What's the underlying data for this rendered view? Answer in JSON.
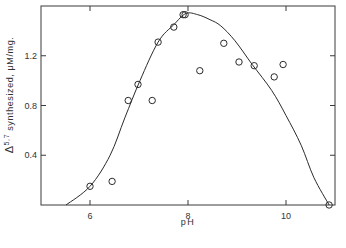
{
  "chart_data": {
    "type": "scatter",
    "title": "",
    "xlabel": "pH",
    "ylabel": "Δ5,7 synthesized, μM/mg.",
    "ylabel_parts": {
      "delta": "Δ",
      "superscript": "5,7",
      "rest": " synthesized, μM/mg."
    },
    "xlim": [
      5.0,
      11.0
    ],
    "ylim": [
      0.0,
      1.6
    ],
    "xticks": [
      6,
      8,
      10
    ],
    "xtick_labels": [
      "6",
      "8",
      "10"
    ],
    "yticks": [
      0.4,
      0.8,
      1.2
    ],
    "ytick_labels": [
      "0.4",
      "0.8",
      "1.2"
    ],
    "grid": false,
    "legend": null,
    "series": [
      {
        "name": "observed",
        "marker": "open-circle",
        "x": [
          6.0,
          6.45,
          6.78,
          6.98,
          7.27,
          7.39,
          7.71,
          7.9,
          7.94,
          8.24,
          8.73,
          9.04,
          9.35,
          9.76,
          9.94,
          10.88
        ],
        "y": [
          0.15,
          0.19,
          0.84,
          0.97,
          0.84,
          1.31,
          1.43,
          1.53,
          1.53,
          1.08,
          1.3,
          1.15,
          1.12,
          1.03,
          1.13,
          0.0
        ]
      },
      {
        "name": "fitted curve",
        "marker": "line",
        "x": [
          5.51,
          6.0,
          6.41,
          6.71,
          7.02,
          7.39,
          7.71,
          7.96,
          8.2,
          8.45,
          8.67,
          8.96,
          9.31,
          9.71,
          10.0,
          10.31,
          10.57,
          10.88
        ],
        "y": [
          0.0,
          0.15,
          0.4,
          0.7,
          1.0,
          1.31,
          1.45,
          1.54,
          1.53,
          1.49,
          1.44,
          1.32,
          1.13,
          0.92,
          0.72,
          0.48,
          0.22,
          0.0
        ]
      }
    ]
  }
}
